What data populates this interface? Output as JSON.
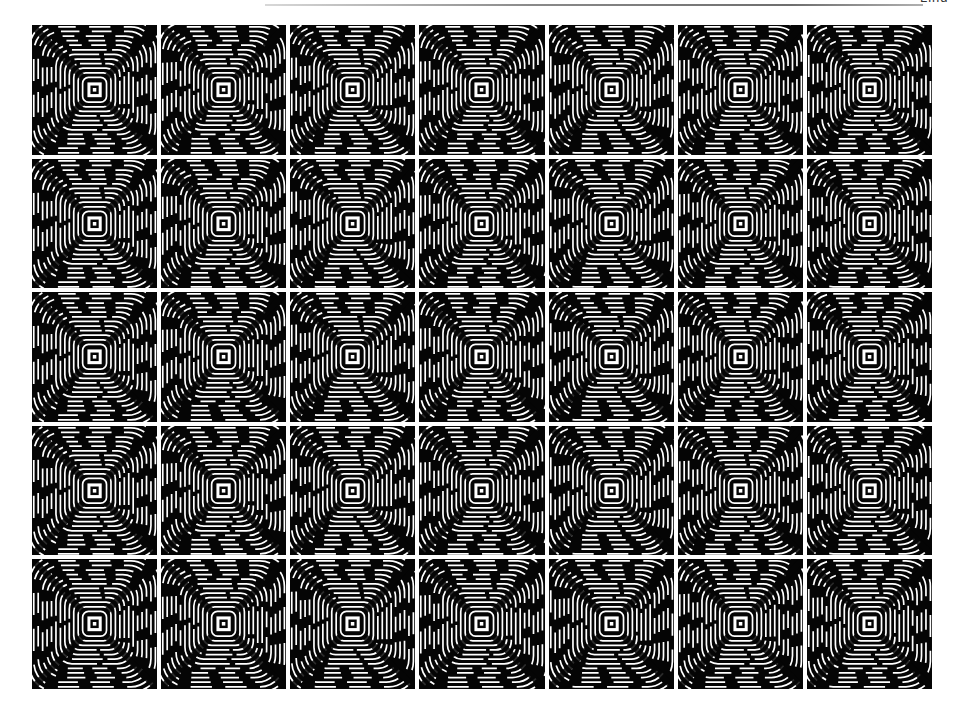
{
  "page": {
    "header_label": "Lind",
    "figure": {
      "rows": 5,
      "columns": 7,
      "tile_pattern": "concentric-square-ring-interference",
      "colors": {
        "background": "#ffffff",
        "tile": "#050505",
        "rings": "#ffffff"
      }
    }
  }
}
